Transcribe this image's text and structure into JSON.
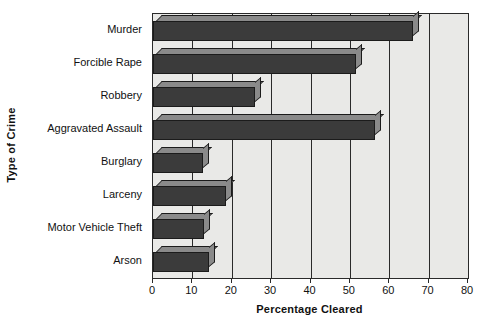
{
  "chart_data": {
    "type": "bar",
    "orientation": "horizontal",
    "title": "",
    "xlabel": "Percentage Cleared",
    "ylabel": "Type of Crime",
    "categories": [
      "Murder",
      "Forcible Rape",
      "Robbery",
      "Aggravated Assault",
      "Burglary",
      "Larceny",
      "Motor Vehicle Theft",
      "Arson"
    ],
    "values": [
      66,
      51.5,
      26,
      56.5,
      12.7,
      18.5,
      13,
      14.2
    ],
    "xlim": [
      0,
      80
    ],
    "xticks": [
      0,
      10,
      20,
      30,
      40,
      50,
      60,
      70,
      80
    ],
    "xtick_labels": [
      "0",
      "10",
      "20",
      "30",
      "40",
      "50",
      "60",
      "70",
      "80"
    ],
    "grid": "vertical",
    "legend": "none",
    "colors": {
      "bar_front": "#3b3b3b",
      "bar_shade": "#8a8a8a",
      "plot_background": "#e9e9e7",
      "axis": "#2a2a2a",
      "text": "#111111",
      "page_background": "#ffffff"
    }
  }
}
